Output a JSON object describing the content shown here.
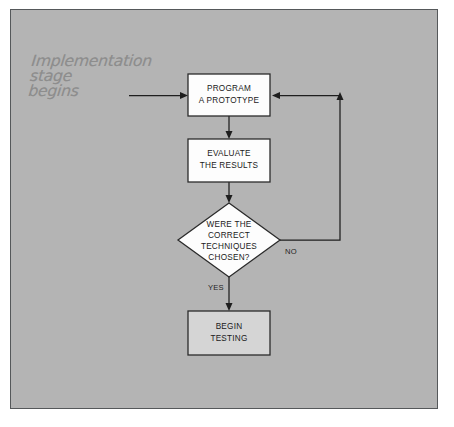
{
  "figure": {
    "kind": "flowchart",
    "panel_color": "#b4b4b4",
    "border_color": "#55585a"
  },
  "annotation": {
    "text": "Implementation\nstage\nbegins",
    "color": "#8d8d8d"
  },
  "nodes": {
    "program_prototype": {
      "id": "program-a-prototype",
      "shape": "rectangle",
      "fill": "#fdfdfd",
      "line1": "PROGRAM",
      "line2": "A PROTOTYPE"
    },
    "evaluate_results": {
      "id": "evaluate-the-results",
      "shape": "rectangle",
      "fill": "#fdfdfd",
      "line1": "EVALUATE",
      "line2": "THE RESULTS"
    },
    "decision": {
      "id": "were-the-correct-techniques-chosen",
      "shape": "diamond",
      "fill": "#fdfdfd",
      "line1": "WERE THE",
      "line2": "CORRECT",
      "line3": "TECHNIQUES",
      "line4": "CHOSEN?"
    },
    "begin_testing": {
      "id": "begin-testing",
      "shape": "rectangle",
      "fill": "#d5d5d5",
      "line1": "BEGIN",
      "line2": "TESTING"
    }
  },
  "edges": {
    "entry": {
      "label": ""
    },
    "prototype_to_evaluate": {
      "label": ""
    },
    "evaluate_to_decision": {
      "label": ""
    },
    "decision_no": {
      "label": "NO"
    },
    "decision_yes": {
      "label": "YES"
    }
  }
}
